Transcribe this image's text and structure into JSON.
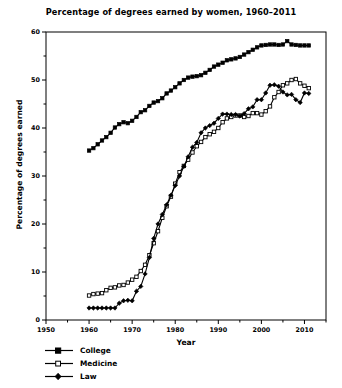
{
  "chart_data": {
    "type": "line",
    "title": "Percentage of degrees earned by women, 1960–2011",
    "xlabel": "Year",
    "ylabel": "Percentage of degrees earned",
    "xlim": [
      1950,
      2015
    ],
    "ylim": [
      0,
      60
    ],
    "xticks": [
      1950,
      1960,
      1970,
      1980,
      1990,
      2000,
      2010
    ],
    "xtick_labels": [
      "1950",
      "1960",
      "1970",
      "1980",
      "1990",
      "2000",
      "2010"
    ],
    "xminor_step": 5,
    "yticks": [
      0,
      10,
      20,
      30,
      40,
      50,
      60
    ],
    "ytick_labels": [
      "0",
      "10",
      "20",
      "30",
      "40",
      "50",
      "60"
    ],
    "yminor_step": 5,
    "grid": false,
    "legend_position": "below-left",
    "marker_color": "#000000",
    "line_color": "#000000",
    "background": "#ffffff",
    "x": [
      1960,
      1961,
      1962,
      1963,
      1964,
      1965,
      1966,
      1967,
      1968,
      1969,
      1970,
      1971,
      1972,
      1973,
      1974,
      1975,
      1976,
      1977,
      1978,
      1979,
      1980,
      1981,
      1982,
      1983,
      1984,
      1985,
      1986,
      1987,
      1988,
      1989,
      1990,
      1991,
      1992,
      1993,
      1994,
      1995,
      1996,
      1997,
      1998,
      1999,
      2000,
      2001,
      2002,
      2003,
      2004,
      2005,
      2006,
      2007,
      2008,
      2009,
      2010,
      2011
    ],
    "series": [
      {
        "name": "College",
        "marker": "filled-square",
        "values": [
          35.3,
          35.8,
          36.6,
          37.4,
          38.1,
          39.0,
          40.1,
          40.8,
          41.2,
          41.0,
          41.5,
          42.3,
          43.3,
          43.7,
          44.6,
          45.3,
          45.6,
          46.2,
          47.2,
          47.8,
          48.5,
          49.3,
          50.0,
          50.5,
          50.7,
          50.8,
          51.0,
          51.5,
          52.1,
          52.8,
          53.2,
          53.6,
          54.1,
          54.3,
          54.5,
          54.8,
          55.3,
          55.8,
          56.3,
          56.8,
          57.2,
          57.3,
          57.4,
          57.4,
          57.3,
          57.4,
          58.1,
          57.4,
          57.3,
          57.2,
          57.2,
          57.2
        ]
      },
      {
        "name": "Medicine",
        "marker": "open-square",
        "values": [
          5.1,
          5.4,
          5.5,
          5.6,
          6.2,
          6.7,
          6.8,
          7.2,
          7.3,
          7.8,
          8.4,
          9.0,
          10.2,
          11.5,
          13.5,
          16.0,
          18.5,
          21.3,
          23.7,
          25.7,
          28.4,
          30.8,
          32.1,
          33.4,
          34.9,
          36.2,
          37.1,
          38.1,
          38.7,
          39.2,
          40.0,
          41.2,
          42.0,
          42.3,
          42.6,
          42.6,
          42.3,
          42.5,
          43.1,
          43.1,
          42.8,
          43.5,
          44.5,
          46.4,
          47.5,
          48.9,
          49.3,
          50.0,
          50.2,
          49.3,
          48.8,
          48.3
        ]
      },
      {
        "name": "Law",
        "marker": "filled-diamond",
        "values": [
          2.5,
          2.5,
          2.5,
          2.5,
          2.5,
          2.5,
          2.5,
          3.5,
          4.0,
          4.1,
          4.0,
          6.0,
          7.0,
          9.6,
          13.0,
          17.0,
          20.0,
          22.0,
          24.0,
          26.0,
          28.0,
          30.0,
          32.0,
          34.0,
          36.0,
          37.0,
          39.0,
          40.0,
          40.5,
          41.0,
          42.0,
          42.9,
          42.9,
          42.8,
          42.8,
          42.5,
          43.0,
          44.0,
          44.4,
          45.9,
          45.9,
          47.3,
          48.9,
          49.0,
          48.7,
          47.5,
          46.9,
          47.0,
          45.9,
          45.3,
          47.3,
          47.2
        ]
      }
    ]
  },
  "legend": {
    "items": [
      {
        "label": "College",
        "marker": "filled-square"
      },
      {
        "label": "Medicine",
        "marker": "open-square"
      },
      {
        "label": "Law",
        "marker": "filled-diamond"
      }
    ]
  }
}
